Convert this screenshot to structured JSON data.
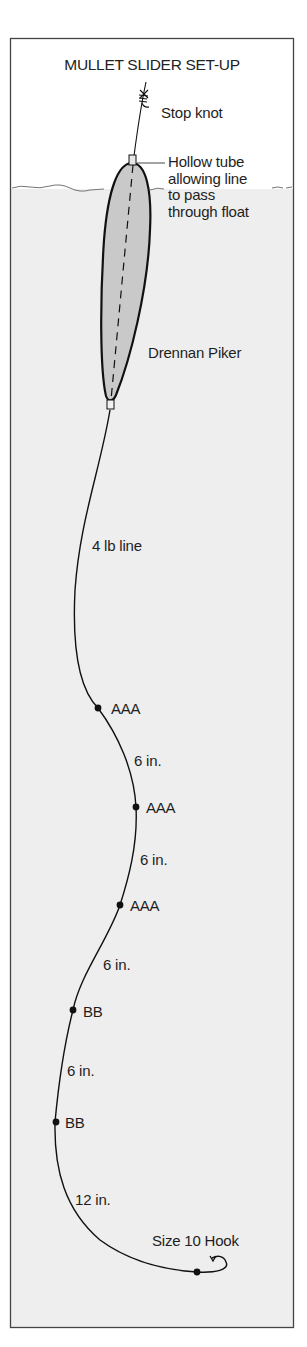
{
  "title": "MULLET SLIDER SET-UP",
  "colors": {
    "background": "#ffffff",
    "frame_border": "#444444",
    "water_fill": "#efefef",
    "float_fill": "#cfcfcf",
    "line": "#111111"
  },
  "labels": {
    "stop_knot": "Stop knot",
    "hollow_tube": "Hollow tube\nallowing line\nto pass\nthrough float",
    "float_name": "Drennan Piker",
    "line_strength": "4 lb line",
    "shot_1": "AAA",
    "gap_1": "6 in.",
    "shot_2": "AAA",
    "gap_2": "6 in.",
    "shot_3": "AAA",
    "gap_3": "6 in.",
    "shot_4": "BB",
    "gap_4": "6 in.",
    "shot_5": "BB",
    "gap_5": "12 in.",
    "hook": "Size 10 Hook"
  },
  "icons": {
    "stop_knot": "stop-knot-icon",
    "float": "float-icon",
    "split_shot": "split-shot-icon",
    "hook": "hook-icon"
  }
}
